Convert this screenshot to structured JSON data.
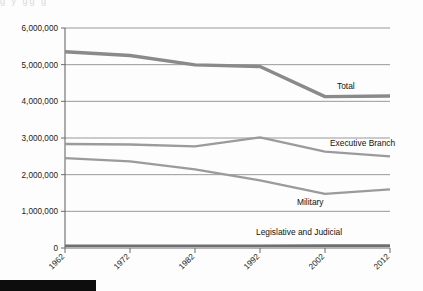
{
  "page": {
    "background_color": "#fdfdfd",
    "bleed_text": "g     y                                            gg      g",
    "black_bar": {
      "name": "page-footer-bar",
      "color": "#0d0d0d"
    }
  },
  "chart_data": {
    "type": "line",
    "title": "",
    "subtitle": "",
    "xlabel": "",
    "ylabel": "",
    "x": [
      "1962",
      "1972",
      "1982",
      "1992",
      "2002",
      "2012"
    ],
    "categories": [
      "1962",
      "1972",
      "1982",
      "1992",
      "2002",
      "2012"
    ],
    "ylim": [
      0,
      6000000
    ],
    "ytick_values": [
      0,
      1000000,
      2000000,
      3000000,
      4000000,
      5000000,
      6000000
    ],
    "ytick_labels": [
      "0",
      "1,000,000",
      "2,000,000",
      "3,000,000",
      "4,000,000",
      "5,000,000",
      "6,000,000"
    ],
    "xtick_labels": [
      "1962",
      "1972",
      "1982",
      "1992",
      "2002",
      "2012"
    ],
    "grid": true,
    "grid_axis": "y",
    "legend": "inline-labels",
    "legend_position": "right-of-line-end",
    "series": [
      {
        "name": "Total",
        "label": "Total",
        "color": "#8a8a8a",
        "width": 3.4,
        "label_x": 337,
        "label_y": 89,
        "values": [
          5354000,
          5249000,
          4994000,
          4951000,
          4128000,
          4146000
        ]
      },
      {
        "name": "Executive Branch",
        "label": "Executive Branch",
        "color": "#9b9b9b",
        "width": 2.3,
        "label_x": 330,
        "label_y": 146,
        "values": [
          2836000,
          2823000,
          2770000,
          3017000,
          2630000,
          2497000
        ]
      },
      {
        "name": "Military",
        "label": "Military",
        "color": "#9b9b9b",
        "width": 2.3,
        "label_x": 297,
        "label_y": 205,
        "values": [
          2450000,
          2360000,
          2146000,
          1847000,
          1478000,
          1601000
        ]
      },
      {
        "name": "Legislative and Judicial",
        "label": "Legislative and Judicial",
        "color": "#6f6f6f",
        "width": 2.6,
        "label_x": 256,
        "label_y": 235,
        "values": [
          60000,
          60000,
          60000,
          62000,
          64000,
          64000
        ]
      }
    ]
  }
}
